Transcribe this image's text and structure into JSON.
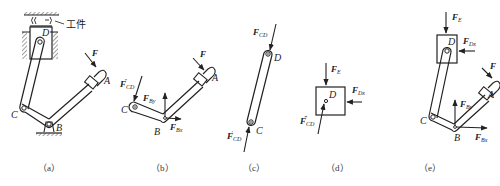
{
  "figure": {
    "colors": {
      "ink": "#222222",
      "background": "#ffffff"
    },
    "panels": [
      {
        "id": "a",
        "caption": "（a）",
        "labels": {
          "D": "D",
          "C": "C",
          "B": "B",
          "A": "A",
          "F": "F",
          "workpiece": "工件"
        }
      },
      {
        "id": "b",
        "caption": "（b）",
        "labels": {
          "C": "C",
          "B": "B",
          "A": "A",
          "F": "F",
          "FCD2_main": "F",
          "FCD2_sub": "CD",
          "FCD2_prime": "″",
          "FBy_main": "F",
          "FBy_sub": "By",
          "FBx_main": "F",
          "FBx_sub": "Bx"
        }
      },
      {
        "id": "c",
        "caption": "（c）",
        "labels": {
          "D": "D",
          "C": "C",
          "FCD_main": "F",
          "FCD_sub": "CD",
          "FCD1_main": "F",
          "FCD1_sub": "CD",
          "FCD1_prime": "′"
        }
      },
      {
        "id": "d",
        "caption": "（d）",
        "labels": {
          "D": "D",
          "FE_main": "F",
          "FE_sub": "E",
          "FDx_main": "F",
          "FDx_sub": "Dx",
          "FCD3_main": "F",
          "FCD3_sub": "CD",
          "FCD3_prime": "‴"
        }
      },
      {
        "id": "e",
        "caption": "（e）",
        "labels": {
          "D": "D",
          "C": "C",
          "B": "B",
          "A": "A",
          "F": "F",
          "FE_main": "F",
          "FE_sub": "E",
          "FDx_main": "F",
          "FDx_sub": "Dx",
          "FBy_main": "F",
          "FBy_sub": "By",
          "FBx_main": "F",
          "FBx_sub": "Bx"
        }
      }
    ]
  }
}
